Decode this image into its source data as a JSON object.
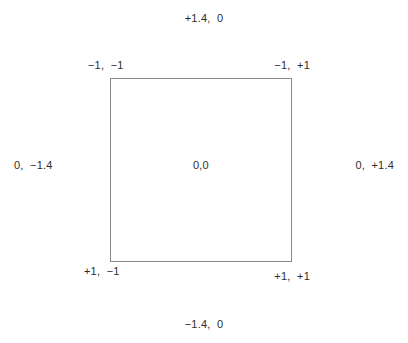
{
  "diagram": {
    "background_color": "#ffffff",
    "border_color": "#8a8a8a",
    "text_color": "#2e2e2e",
    "square": {
      "x": 110,
      "y": 78,
      "width": 182,
      "height": 184
    },
    "labels": {
      "top": "+1.4,  0",
      "bottom": "−1.4,  0",
      "left": "0,  −1.4",
      "right": "0,  +1.4",
      "center": "0,0",
      "top_left": "−1,  −1",
      "top_right": "−1,  +1",
      "bottom_left": "+1,  −1",
      "bottom_right": "+1,  +1"
    }
  }
}
